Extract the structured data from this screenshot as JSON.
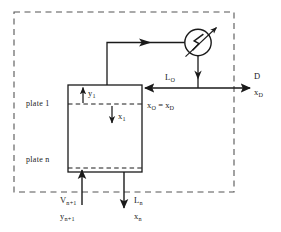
{
  "diagram": {
    "colors": {
      "line": "#1a1a1a",
      "dashed_boundary": "#555555",
      "background": "#ffffff",
      "text": "#1a1a1a"
    },
    "boundary": {
      "name": "control-volume-boundary",
      "style": "dashed"
    },
    "column": {
      "name": "distillation-column",
      "plate_top_label": "plate 1",
      "plate_bottom_label": "plate n"
    },
    "condenser": {
      "name": "condenser",
      "symbol": "heat-exchanger-zigzag"
    },
    "streams": {
      "vapor_overhead": {
        "label": "",
        "direction": "up-right"
      },
      "reflux": {
        "flow_label": "L",
        "flow_sub": "O",
        "comp_label": "x",
        "comp_sub": "O",
        "comp_equals": "=",
        "comp_label2": "x",
        "comp_sub2": "D",
        "direction": "left"
      },
      "distillate": {
        "flow_label": "D",
        "comp_label": "x",
        "comp_sub": "D",
        "direction": "right"
      },
      "vapor_feed": {
        "flow_label": "V",
        "flow_sub": "n+1",
        "comp_label": "y",
        "comp_sub": "n+1",
        "direction": "up"
      },
      "liquid_bottoms": {
        "flow_label": "L",
        "flow_sub": "n",
        "comp_label": "x",
        "comp_sub": "n",
        "direction": "down"
      },
      "vapor_plate1": {
        "comp_label": "y",
        "comp_sub": "1",
        "direction": "up"
      },
      "liquid_plate1": {
        "comp_label": "x",
        "comp_sub": "1",
        "direction": "down"
      }
    }
  }
}
